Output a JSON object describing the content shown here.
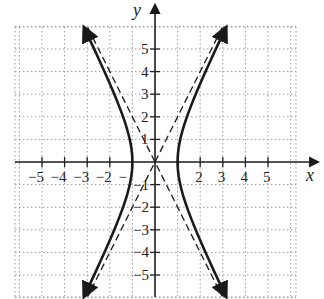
{
  "chart_data": {
    "type": "line",
    "title": "",
    "xlabel": "x",
    "ylabel": "y",
    "xlim": [
      -6.2,
      6.2
    ],
    "ylim": [
      -6,
      6
    ],
    "grid": true,
    "grid_style": "dotted",
    "x_ticks": [
      -5,
      -4,
      -3,
      -2,
      -1,
      1,
      2,
      3,
      4,
      5
    ],
    "y_ticks": [
      -5,
      -4,
      -3,
      -2,
      -1,
      1,
      2,
      3,
      4,
      5
    ],
    "x_tick_labels": [
      "−5",
      "−4",
      "−3",
      "−2",
      "−",
      "1",
      "2",
      "3",
      "4",
      "5"
    ],
    "y_tick_labels": [
      "−5",
      "−4",
      "−3",
      "−2",
      "−1",
      "1",
      "2",
      "3",
      "4",
      "5"
    ],
    "series": [
      {
        "name": "hyperbola",
        "equation": "x^2 - y^2/4 = 1",
        "style": "solid",
        "vertices": [
          [
            -1,
            0
          ],
          [
            1,
            0
          ]
        ]
      },
      {
        "name": "asymptote-1",
        "equation": "y = 2x",
        "style": "dashed"
      },
      {
        "name": "asymptote-2",
        "equation": "y = -2x",
        "style": "dashed"
      }
    ]
  },
  "labels": {
    "x_axis": "x",
    "y_axis": "y",
    "x_ticks": [
      "−5",
      "−4",
      "−3",
      "−2",
      "−",
      "2",
      "3",
      "4",
      "5"
    ],
    "y_ticks": [
      "5",
      "4",
      "3",
      "2",
      "1",
      "−1",
      "−2",
      "−3",
      "−4",
      "−5"
    ]
  },
  "colors": {
    "curve": "#1a1a1a",
    "grid": "#9a9a9a",
    "axis": "#222222"
  }
}
